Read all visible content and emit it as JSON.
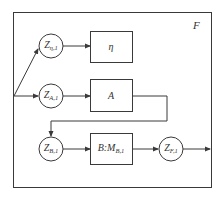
{
  "diagram": {
    "frame_label": "F",
    "nodes": [
      {
        "id": "z_eta",
        "main": "Z",
        "sub": "η,1",
        "cx": 51,
        "cy": 46
      },
      {
        "id": "z_a",
        "main": "Z",
        "sub": "A,1",
        "cx": 51,
        "cy": 96
      },
      {
        "id": "z_b",
        "main": "Z",
        "sub": "B,1",
        "cx": 51,
        "cy": 149
      },
      {
        "id": "z_f",
        "main": "Z",
        "sub": "F,1",
        "cx": 171,
        "cy": 149
      }
    ],
    "boxes": [
      {
        "id": "eta",
        "main": "η",
        "sub": ""
      },
      {
        "id": "a",
        "main": "A",
        "sub": ""
      },
      {
        "id": "b",
        "main": "B:M",
        "sub": "B,1"
      }
    ],
    "edges": [
      {
        "from": "input",
        "to": "z_eta"
      },
      {
        "from": "input",
        "to": "z_a"
      },
      {
        "from": "z_eta",
        "to": "eta"
      },
      {
        "from": "z_a",
        "to": "a"
      },
      {
        "from": "a",
        "to": "z_b"
      },
      {
        "from": "z_b",
        "to": "b"
      },
      {
        "from": "b",
        "to": "z_f"
      },
      {
        "from": "z_f",
        "to": "output"
      }
    ],
    "colors": {
      "stroke": "#3a3a3a",
      "background": "#ffffff"
    }
  }
}
